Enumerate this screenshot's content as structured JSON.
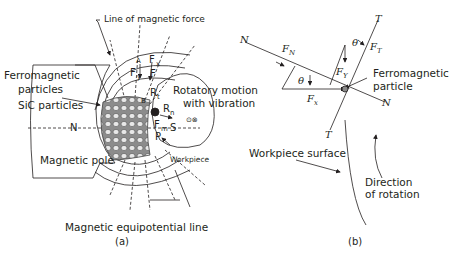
{
  "figure_a": {
    "caption": "(a)",
    "labels": {
      "line_of_force": "Line of magnetic force",
      "ferromagnetic_particles_1": "Ferromagnetic",
      "ferromagnetic_particles_2": "particles",
      "sic_particles": "SiC particles",
      "n_pole": "N",
      "magnetic_pole": "Magnetic pole",
      "rotatory_1": "Rotatory motion",
      "rotatory_2": "with vibration",
      "workpiece": "Workpiece",
      "equipotential": "Magnetic equipotential line",
      "s": "S",
      "p": "P",
      "rn": "R",
      "rn_sub": "n",
      "rt": "R",
      "rt_sub": "t",
      "fm": "F",
      "fm_sub": "m",
      "fx": "F",
      "fx_sub": "x",
      "fy": "F",
      "fy_sub": "y",
      "f": "F",
      "marker_a": "A",
      "marker_b": "B",
      "dot_symbols": "⊙⊗"
    }
  },
  "figure_b": {
    "caption": "(b)",
    "labels": {
      "n_top": "N",
      "n_bottom": "N",
      "t_top": "T",
      "t_bottom": "T",
      "fn": "F",
      "fn_sub": "N",
      "ft": "F",
      "ft_sub": "T",
      "fx": "F",
      "fx_sub": "x",
      "fy": "F",
      "fy_sub": "Y",
      "theta1": "θ",
      "theta2": "θ",
      "ferro_1": "Ferromagnetic",
      "ferro_2": "particle",
      "workpiece_surface": "Workpiece surface",
      "direction_1": "Direction",
      "direction_2": "of rotation"
    }
  }
}
